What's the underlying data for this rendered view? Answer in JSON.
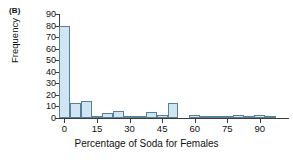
{
  "figure": {
    "panel_label": "(B)",
    "background_color": "#ffffff"
  },
  "chart_data": {
    "type": "bar",
    "title": "",
    "subtitle": "",
    "xlabel": "Percentage of Soda for Females",
    "ylabel": "Frequency",
    "xlim": [
      -2.5,
      102.5
    ],
    "ylim": [
      0,
      90
    ],
    "xticks": [
      0,
      15,
      30,
      45,
      60,
      75,
      90
    ],
    "xtick_labels": [
      "0",
      "15",
      "30",
      "45",
      "60",
      "75",
      "90"
    ],
    "yticks": [
      0,
      10,
      20,
      30,
      40,
      50,
      60,
      70,
      80,
      90
    ],
    "ytick_labels": [
      "0",
      "10",
      "20",
      "30",
      "40",
      "50",
      "60",
      "70",
      "80",
      "90"
    ],
    "grid": false,
    "legend": null,
    "bar_fill_color": "#cfe5f2",
    "bar_edge_color": "#5a7f99",
    "axis_color": "#3c3c3c",
    "bin_width": 5,
    "bin_starts": [
      -2.5,
      2.5,
      7.5,
      12.5,
      17.5,
      22.5,
      27.5,
      32.5,
      37.5,
      42.5,
      47.5,
      52.5,
      57.5,
      62.5,
      67.5,
      72.5,
      77.5,
      82.5,
      87.5,
      92.5,
      97.5
    ],
    "categories": [
      "0",
      "5",
      "10",
      "15",
      "20",
      "25",
      "30",
      "35",
      "40",
      "45",
      "50",
      "55",
      "60",
      "65",
      "70",
      "75",
      "80",
      "85",
      "90",
      "95",
      "100"
    ],
    "values": [
      80,
      13,
      15,
      2,
      4,
      6,
      1,
      1,
      5,
      3,
      13,
      0,
      3,
      1,
      2,
      2,
      3,
      1,
      3,
      1,
      0
    ]
  }
}
